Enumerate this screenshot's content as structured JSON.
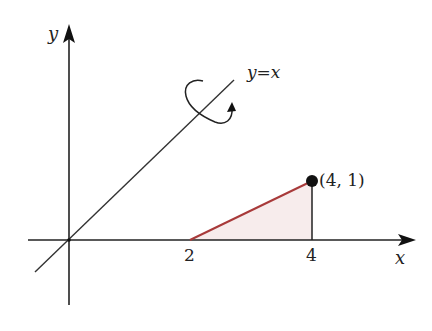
{
  "diagram": {
    "axes": {
      "x_label": "x",
      "y_label": "y"
    },
    "line_label": "y=x",
    "point_label": "(4, 1)",
    "ticks": [
      {
        "value": "2"
      },
      {
        "value": "4"
      }
    ],
    "region": {
      "description": "Triangular region bounded by segment from (2,0) to (4,1), the vertical line x=4, and the x-axis",
      "vertices": [
        [
          2,
          0
        ],
        [
          4,
          1
        ],
        [
          4,
          0
        ]
      ],
      "fill_color": "#f7ecec",
      "edge_color": "#a83a3a"
    },
    "rotation_axis": "y=x",
    "colors": {
      "axis": "#222222",
      "line": "#333333",
      "point": "#111111"
    }
  }
}
